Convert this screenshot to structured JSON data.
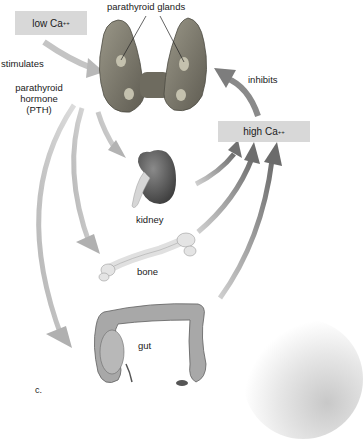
{
  "diagram": {
    "panel_label": "c.",
    "nodes": {
      "low_ca": {
        "text": "low Ca",
        "sup": "++"
      },
      "high_ca": {
        "text": "high Ca",
        "sup": "++"
      }
    },
    "labels": {
      "parathyroid_glands": "parathyroid glands",
      "stimulates": "stimulates",
      "inhibits": "inhibits",
      "pth_line1": "parathyroid",
      "pth_line2": "hormone",
      "pth_line3": "(PTH)",
      "kidney": "kidney",
      "bone": "bone",
      "gut": "gut"
    },
    "colors": {
      "box_fill": "#d8d8d8",
      "arrow_light": "#bdbdbd",
      "arrow_dark": "#7a7a7a",
      "gland": "#7d7a6c",
      "kidney": "#5a5a5a",
      "bone": "#e2e2e2",
      "gut": "#a9a9a9"
    },
    "relations": [
      {
        "from": "low Ca++",
        "to": "parathyroid glands",
        "label": "stimulates"
      },
      {
        "from": "parathyroid glands",
        "to": "kidney",
        "label": "parathyroid hormone (PTH)"
      },
      {
        "from": "parathyroid glands",
        "to": "bone",
        "label": "parathyroid hormone (PTH)"
      },
      {
        "from": "parathyroid glands",
        "to": "gut",
        "label": "parathyroid hormone (PTH)"
      },
      {
        "from": "kidney",
        "to": "high Ca++",
        "label": ""
      },
      {
        "from": "bone",
        "to": "high Ca++",
        "label": ""
      },
      {
        "from": "gut",
        "to": "high Ca++",
        "label": ""
      },
      {
        "from": "high Ca++",
        "to": "parathyroid glands",
        "label": "inhibits"
      }
    ]
  }
}
